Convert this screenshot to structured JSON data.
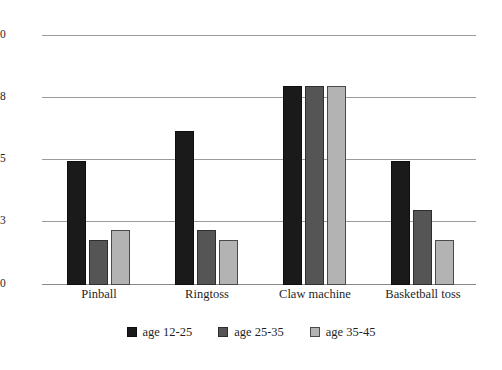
{
  "chart_data": {
    "type": "bar",
    "title": "",
    "subtitle": "",
    "xlabel": "",
    "ylabel": "",
    "categories": [
      "Pinball",
      "Ringtoss",
      "Claw machine",
      "Basketball toss"
    ],
    "series": [
      {
        "name": "age 12-25",
        "color": "#1a1a1a",
        "values": [
          25,
          31,
          40,
          25
        ]
      },
      {
        "name": "age 25-35",
        "color": "#555555",
        "values": [
          9,
          11,
          40,
          15
        ]
      },
      {
        "name": "age 35-45",
        "color": "#b3b3b3",
        "values": [
          11,
          9,
          40,
          9
        ]
      }
    ],
    "ylim": [
      0,
      50
    ],
    "yticks": [
      0,
      13,
      25,
      38,
      50
    ],
    "ytick_labels": [
      "0",
      "13",
      "25",
      "38",
      "50"
    ],
    "grid": true,
    "grid_axis": "y",
    "legend_position": "bottom-center",
    "background_color": "#ffffff",
    "grid_color": "#9b9b9b"
  }
}
